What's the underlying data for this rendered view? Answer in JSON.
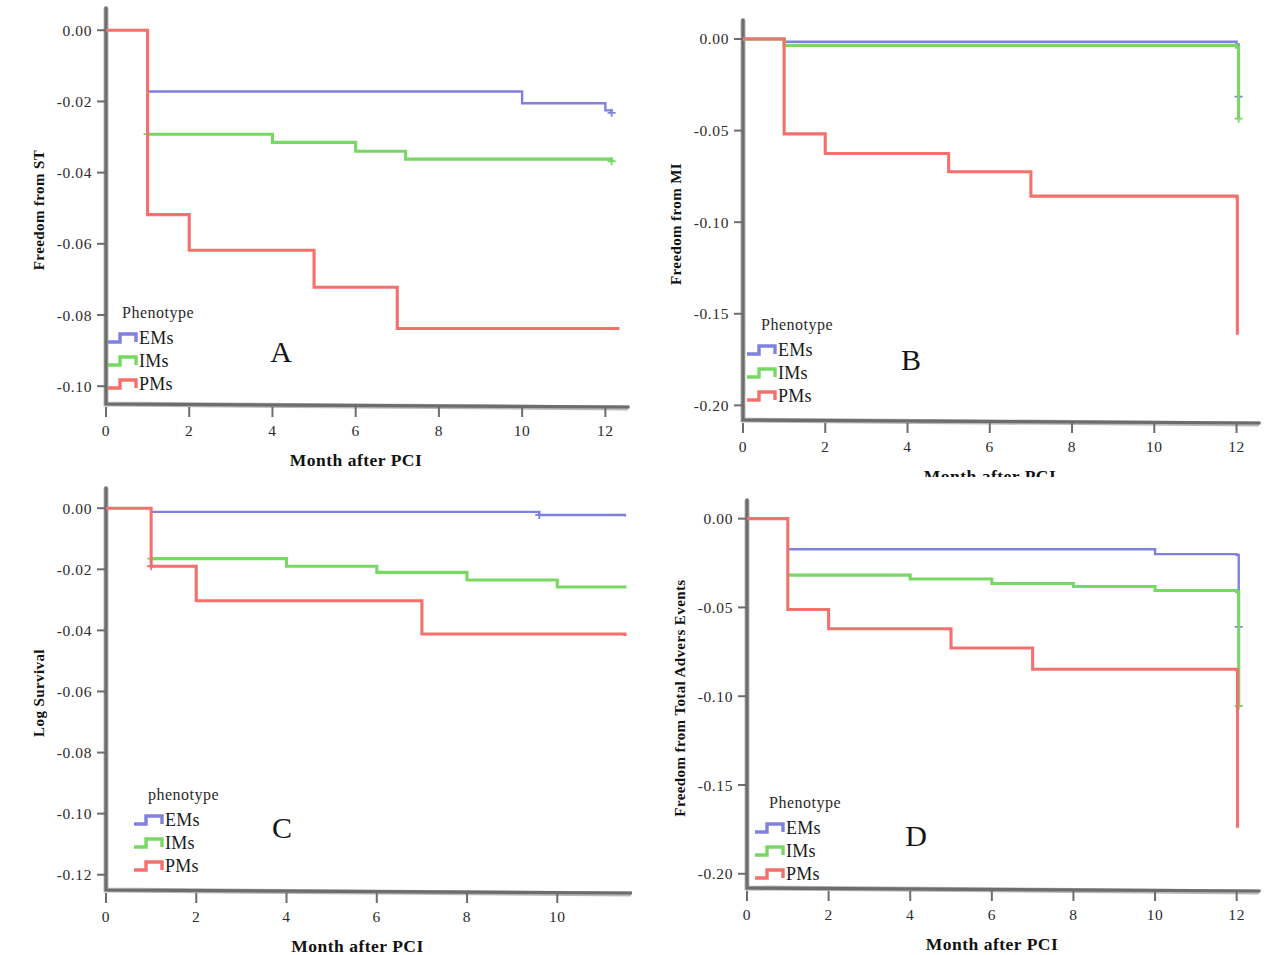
{
  "figure": {
    "background": "#ffffff",
    "panel_count": 4
  },
  "colors": {
    "EMs": "#7f80e0",
    "IMs": "#77d963",
    "PMs": "#f4706c",
    "axis": "#6d6d6d",
    "text": "#1b1b1b"
  },
  "legend": {
    "title_default": "Phenotype",
    "entries": [
      {
        "label": "EMs",
        "color_key": "EMs"
      },
      {
        "label": "IMs",
        "color_key": "IMs"
      },
      {
        "label": "PMs",
        "color_key": "PMs"
      }
    ]
  },
  "panels": {
    "A": {
      "letter": "A",
      "legend_title": "Phenotype",
      "xlabel": "Month after PCI",
      "ylabel": "Freedom from ST",
      "xticks": [
        0,
        2,
        4,
        6,
        8,
        10,
        12
      ],
      "xticklabels": [
        "0",
        "2",
        "4",
        "6",
        "8",
        "10",
        "12"
      ],
      "yticks": [
        0.0,
        -0.02,
        -0.04,
        -0.06,
        -0.08,
        -0.1
      ],
      "yticklabels": [
        "0.00",
        "-0.02",
        "-0.04",
        "-0.06",
        "-0.08",
        "-0.10"
      ],
      "xlim": [
        0,
        12.4
      ],
      "ylim": [
        -0.105,
        0.004
      ]
    },
    "B": {
      "letter": "B",
      "legend_title": "Phenotype",
      "xlabel": "Month after PCI",
      "ylabel": "Freedom from MI",
      "xticks": [
        0,
        2,
        4,
        6,
        8,
        10,
        12
      ],
      "xticklabels": [
        "0",
        "2",
        "4",
        "6",
        "8",
        "10",
        "12"
      ],
      "yticks": [
        0.0,
        -0.05,
        -0.1,
        -0.15,
        -0.2
      ],
      "yticklabels": [
        "0.00",
        "-0.05",
        "-0.10",
        "-0.15",
        "-0.20"
      ],
      "xlim": [
        0,
        12.4
      ],
      "ylim": [
        -0.208,
        0.006
      ]
    },
    "C": {
      "letter": "C",
      "legend_title": "phenotype",
      "xlabel": "Month after PCI",
      "ylabel": "Log Survival",
      "xticks": [
        0,
        2,
        4,
        6,
        8,
        10
      ],
      "xticklabels": [
        "0",
        "2",
        "4",
        "6",
        "8",
        "10"
      ],
      "yticks": [
        0.0,
        -0.02,
        -0.04,
        -0.06,
        -0.08,
        -0.1,
        -0.12
      ],
      "yticklabels": [
        "0.00",
        "-0.02",
        "-0.04",
        "-0.06",
        "-0.08",
        "-0.10",
        "-0.12"
      ],
      "xlim": [
        0,
        11.5
      ],
      "ylim": [
        -0.125,
        0.004
      ]
    },
    "D": {
      "letter": "D",
      "legend_title": "Phenotype",
      "xlabel": "Month after PCI",
      "ylabel": "Freedom from Total Advers Events",
      "xticks": [
        0,
        2,
        4,
        6,
        8,
        10,
        12
      ],
      "xticklabels": [
        "0",
        "2",
        "4",
        "6",
        "8",
        "10",
        "12"
      ],
      "yticks": [
        0.0,
        -0.05,
        -0.1,
        -0.15,
        -0.2
      ],
      "yticklabels": [
        "0.00",
        "-0.05",
        "-0.10",
        "-0.15",
        "-0.20"
      ],
      "xlim": [
        0,
        12.4
      ],
      "ylim": [
        -0.208,
        0.006
      ]
    }
  },
  "chart_data": [
    {
      "panel": "A",
      "type": "line",
      "title": "A",
      "xlabel": "Month after PCI",
      "ylabel": "Freedom from ST",
      "xlim": [
        0,
        12.4
      ],
      "ylim": [
        -0.105,
        0.004
      ],
      "grid": false,
      "legend_position": "lower-left",
      "step": "post",
      "series": [
        {
          "name": "EMs",
          "color": "#7f80e0",
          "x": [
            1,
            10,
            12,
            12.15
          ],
          "y": [
            -0.0172,
            -0.0205,
            -0.0225,
            -0.0232
          ],
          "censored": [
            {
              "x": 12.15,
              "y": -0.0232
            }
          ]
        },
        {
          "name": "IMs",
          "color": "#77d963",
          "x": [
            1,
            4,
            6,
            7.2,
            12.15
          ],
          "y": [
            -0.0292,
            -0.0315,
            -0.034,
            -0.0362,
            -0.0368
          ],
          "censored": [
            {
              "x": 1,
              "y": -0.0292
            },
            {
              "x": 12.15,
              "y": -0.0368
            }
          ]
        },
        {
          "name": "PMs",
          "color": "#f4706c",
          "x": [
            0,
            1,
            2,
            5,
            7,
            12.3
          ],
          "y": [
            0.0,
            -0.0518,
            -0.0618,
            -0.0722,
            -0.0838,
            -0.0842
          ],
          "censored": []
        }
      ]
    },
    {
      "panel": "B",
      "type": "line",
      "title": "B",
      "xlabel": "Month after PCI",
      "ylabel": "Freedom from MI",
      "xlim": [
        0,
        12.4
      ],
      "ylim": [
        -0.208,
        0.006
      ],
      "grid": false,
      "legend_position": "lower-left",
      "step": "post",
      "series": [
        {
          "name": "EMs",
          "color": "#7f80e0",
          "x": [
            0,
            1,
            12,
            12,
            12.05
          ],
          "y": [
            0.0,
            -0.0015,
            -0.003,
            -0.003,
            -0.0315
          ],
          "censored": [
            {
              "x": 12.05,
              "y": -0.0315
            }
          ]
        },
        {
          "name": "IMs",
          "color": "#77d963",
          "x": [
            0,
            1,
            12,
            12,
            12.05
          ],
          "y": [
            0.0,
            -0.0035,
            -0.0045,
            -0.0045,
            -0.0435
          ],
          "censored": [
            {
              "x": 12.05,
              "y": -0.0435
            }
          ]
        },
        {
          "name": "PMs",
          "color": "#f4706c",
          "x": [
            0,
            1,
            2,
            5,
            7,
            12,
            12,
            12.02
          ],
          "y": [
            0.0,
            -0.0518,
            -0.0625,
            -0.0725,
            -0.0858,
            -0.0862,
            -0.0862,
            -0.1615
          ],
          "censored": []
        }
      ]
    },
    {
      "panel": "C",
      "type": "line",
      "title": "C",
      "xlabel": "Month after PCI",
      "ylabel": "Log Survival",
      "xlim": [
        0,
        11.5
      ],
      "ylim": [
        -0.125,
        0.004
      ],
      "grid": false,
      "legend_position": "lower-left",
      "step": "post",
      "series": [
        {
          "name": "EMs",
          "color": "#7f80e0",
          "x": [
            1,
            9.6,
            11.5
          ],
          "y": [
            -0.0012,
            -0.0022,
            -0.0027
          ],
          "censored": [
            {
              "x": 9.6,
              "y": -0.0022
            }
          ]
        },
        {
          "name": "IMs",
          "color": "#77d963",
          "x": [
            1,
            4,
            6,
            8,
            10,
            11.5
          ],
          "y": [
            -0.0165,
            -0.019,
            -0.021,
            -0.0235,
            -0.0258,
            -0.0262
          ],
          "censored": [
            {
              "x": 1,
              "y": -0.0165
            }
          ]
        },
        {
          "name": "PMs",
          "color": "#f4706c",
          "x": [
            0,
            1,
            2,
            7,
            11.5
          ],
          "y": [
            0.0,
            -0.019,
            -0.0303,
            -0.0412,
            -0.0418
          ],
          "censored": [
            {
              "x": 1,
              "y": -0.019
            }
          ]
        }
      ]
    },
    {
      "panel": "D",
      "type": "line",
      "title": "D",
      "xlabel": "Month after PCI",
      "ylabel": "Freedom from Total Advers Events",
      "xlim": [
        0,
        12.4
      ],
      "ylim": [
        -0.208,
        0.006
      ],
      "grid": false,
      "legend_position": "lower-left",
      "step": "post",
      "series": [
        {
          "name": "EMs",
          "color": "#7f80e0",
          "x": [
            1,
            10,
            12,
            12,
            12.05
          ],
          "y": [
            -0.0172,
            -0.02,
            -0.0205,
            -0.0205,
            -0.061
          ],
          "censored": [
            {
              "x": 12.05,
              "y": -0.061
            }
          ]
        },
        {
          "name": "IMs",
          "color": "#77d963",
          "x": [
            1,
            4,
            6,
            8,
            10,
            12,
            12,
            12.05
          ],
          "y": [
            -0.0318,
            -0.034,
            -0.0365,
            -0.0382,
            -0.0405,
            -0.0412,
            -0.0412,
            -0.1055
          ],
          "censored": [
            {
              "x": 12.05,
              "y": -0.1055
            }
          ]
        },
        {
          "name": "PMs",
          "color": "#f4706c",
          "x": [
            0,
            1,
            2,
            5,
            7,
            12,
            12,
            12.02
          ],
          "y": [
            0.0,
            -0.0512,
            -0.062,
            -0.0728,
            -0.0848,
            -0.0852,
            -0.0852,
            -0.174
          ],
          "censored": []
        }
      ]
    }
  ]
}
